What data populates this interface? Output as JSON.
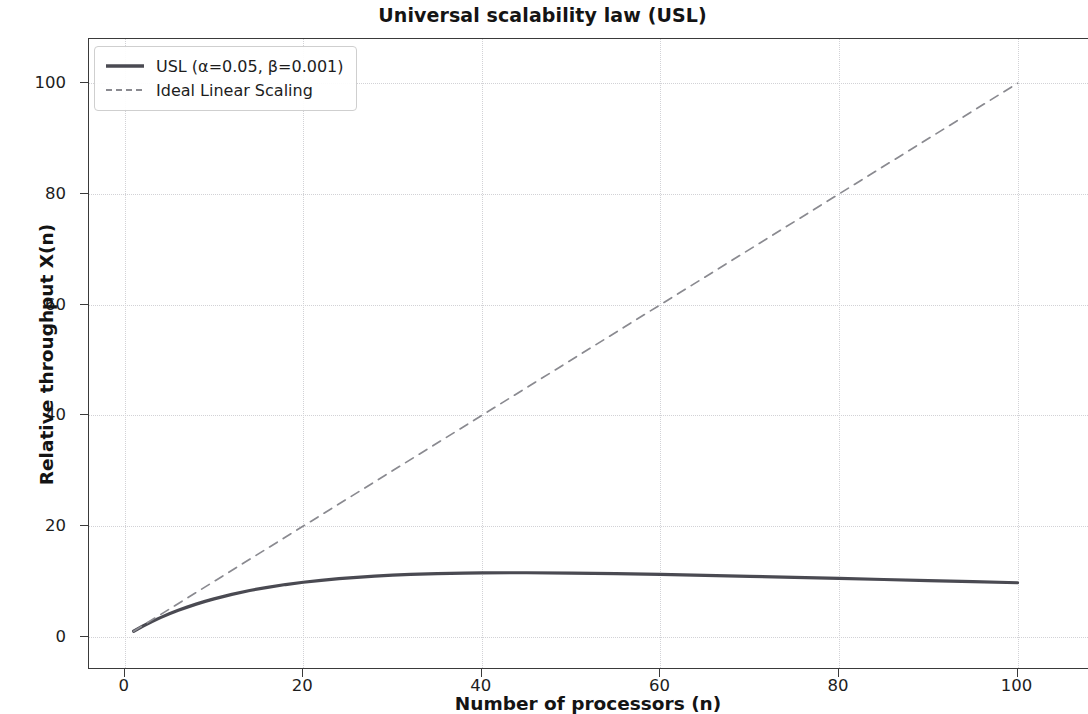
{
  "chart_data": {
    "type": "line",
    "title": "Universal scalability law (USL)",
    "xlabel": "Number of processors (n)",
    "ylabel": "Relative throughput X(n)",
    "xlim": [
      -4,
      108
    ],
    "ylim": [
      -6,
      108
    ],
    "xticks": [
      0,
      20,
      40,
      60,
      80,
      100
    ],
    "xtick_labels": [
      "0",
      "20",
      "40",
      "60",
      "80",
      "100"
    ],
    "yticks": [
      0,
      20,
      40,
      60,
      80,
      100
    ],
    "ytick_labels": [
      "0",
      "20",
      "40",
      "60",
      "80",
      "100"
    ],
    "grid": true,
    "grid_style": "dotted",
    "legend_position": "upper left",
    "parameters": {
      "alpha": 0.05,
      "beta": 0.001
    },
    "series": [
      {
        "name": "USL (α=0.05, β=0.001)",
        "style": "solid",
        "color": "#4a4a52",
        "linewidth": 3.2,
        "x": [
          1,
          2,
          3,
          4,
          5,
          6,
          7,
          8,
          9,
          10,
          12,
          14,
          16,
          18,
          20,
          22,
          24,
          26,
          28,
          30,
          32,
          35,
          38,
          40,
          45,
          50,
          55,
          60,
          65,
          70,
          75,
          80,
          85,
          90,
          95,
          100
        ],
        "y": [
          1.0,
          1.9,
          2.72,
          3.46,
          4.15,
          4.78,
          5.36,
          5.9,
          6.4,
          6.85,
          7.67,
          8.36,
          8.94,
          9.44,
          9.85,
          10.2,
          10.5,
          10.75,
          10.95,
          11.13,
          11.26,
          11.42,
          11.52,
          11.56,
          11.57,
          11.51,
          11.41,
          11.27,
          11.11,
          10.93,
          10.74,
          10.55,
          10.35,
          10.15,
          9.95,
          9.76
        ]
      },
      {
        "name": "Ideal Linear Scaling",
        "style": "dashed",
        "color": "#8a8a90",
        "linewidth": 1.7,
        "x": [
          1,
          100
        ],
        "y": [
          1,
          100
        ]
      }
    ]
  },
  "legend": {
    "items": [
      {
        "label": "USL (α=0.05, β=0.001)",
        "swatch": "solid-line-swatch"
      },
      {
        "label": "Ideal Linear Scaling",
        "swatch": "dashed-line-swatch"
      }
    ]
  }
}
